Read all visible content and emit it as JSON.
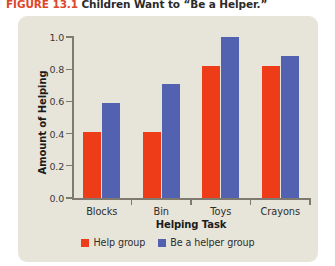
{
  "figure": {
    "number": "FIGURE 13.1",
    "title": "Children Want to “Be a Helper.”"
  },
  "colors": {
    "help_group": "#ee3b18",
    "be_a_helper_group": "#5262b0",
    "panel_background": "#e7e4da",
    "axis": "#7e7a70",
    "figure_number": "#e0452a"
  },
  "chart_data": {
    "type": "bar",
    "title": "Children Want to “Be a Helper.”",
    "xlabel": "Helping Task",
    "ylabel": "Amount of Helping",
    "categories": [
      "Blocks",
      "Bin",
      "Toys",
      "Crayons"
    ],
    "series": [
      {
        "name": "Help group",
        "color": "#ee3b18",
        "values": [
          0.41,
          0.41,
          0.82,
          0.82
        ]
      },
      {
        "name": "Be a helper group",
        "color": "#5262b0",
        "values": [
          0.59,
          0.71,
          1.0,
          0.88
        ]
      }
    ],
    "ylim": [
      0.0,
      1.0
    ],
    "yticks": [
      "0.0",
      "0.2",
      "0.4",
      "0.6",
      "0.8",
      "1.0"
    ],
    "ytick_values": [
      0.0,
      0.2,
      0.4,
      0.6,
      0.8,
      1.0
    ],
    "grid": false,
    "legend_position": "bottom-center"
  }
}
